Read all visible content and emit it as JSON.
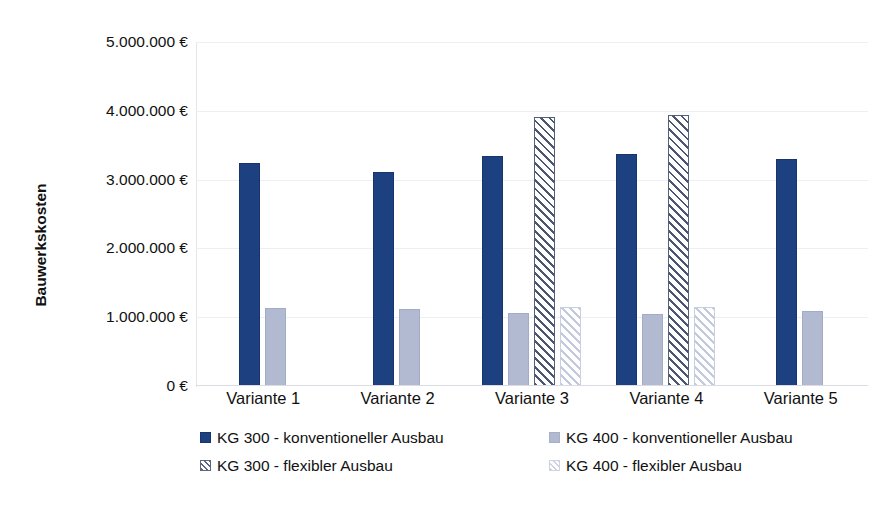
{
  "chart_data": {
    "type": "bar",
    "title": "",
    "subtitle": "",
    "xlabel": "",
    "ylabel": "Bauwerkskosten",
    "ylim": [
      0,
      5000000
    ],
    "ytick_values": [
      0,
      1000000,
      2000000,
      3000000,
      4000000,
      5000000
    ],
    "ytick_labels": [
      "0 €",
      "1.000.000 €",
      "2.000.000 €",
      "3.000.000 €",
      "4.000.000 €",
      "5.000.000 €"
    ],
    "grid": true,
    "legend_position": "bottom",
    "currency": "€",
    "categories": [
      "Variante 1",
      "Variante 2",
      "Variante 3",
      "Variante 4",
      "Variante 5"
    ],
    "series": [
      {
        "name": "KG 300 - konventioneller Ausbau",
        "key": "kg300-konv",
        "color": "#1d4080",
        "pattern": "solid",
        "values": [
          3240000,
          3110000,
          3340000,
          3370000,
          3300000
        ]
      },
      {
        "name": "KG 400 - konventioneller Ausbau",
        "key": "kg400-konv",
        "color": "#b2bad2",
        "pattern": "solid",
        "values": [
          1130000,
          1120000,
          1060000,
          1050000,
          1090000
        ]
      },
      {
        "name": "KG 300 - flexibler Ausbau",
        "key": "kg300-flex",
        "color": "#4b5670",
        "pattern": "diagonal-hatch",
        "values": [
          null,
          null,
          3910000,
          3940000,
          null
        ]
      },
      {
        "name": "KG 400 - flexibler Ausbau",
        "key": "kg400-flex",
        "color": "#c3cadd",
        "pattern": "diagonal-hatch",
        "values": [
          null,
          null,
          1150000,
          1150000,
          null
        ]
      }
    ]
  },
  "legend": {
    "items": [
      {
        "label": "KG 300 - konventioneller Ausbau",
        "key": "kg300-konv"
      },
      {
        "label": "KG 400 - konventioneller Ausbau",
        "key": "kg400-konv"
      },
      {
        "label": "KG 300 - flexibler Ausbau",
        "key": "kg300-flex"
      },
      {
        "label": "KG 400 - flexibler Ausbau",
        "key": "kg400-flex"
      }
    ]
  },
  "colors": {
    "kg300_konventionell": "#1d4080",
    "kg400_konventionell": "#b2bad2",
    "kg300_flexibel": "#4b5670",
    "kg400_flexibel": "#c3cadd",
    "gridline": "#eceff3",
    "axis": "#d9dde3",
    "text": "#111111",
    "background": "#ffffff"
  }
}
